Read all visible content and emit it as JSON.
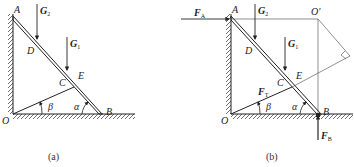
{
  "figure_a": {
    "caption": "(a)",
    "points": [
      "A",
      "B",
      "C",
      "D",
      "E",
      "O"
    ],
    "forces": [
      {
        "name": "G",
        "sub": "2"
      },
      {
        "name": "G",
        "sub": "1"
      }
    ],
    "angles": [
      "β",
      "α"
    ]
  },
  "figure_b": {
    "caption": "(b)",
    "points": [
      "A",
      "B",
      "C",
      "D",
      "E",
      "O",
      "O′"
    ],
    "forces": [
      {
        "name": "F",
        "sub": "A"
      },
      {
        "name": "G",
        "sub": "2"
      },
      {
        "name": "G",
        "sub": "1"
      },
      {
        "name": "F",
        "sub": "T"
      },
      {
        "name": "F",
        "sub": "B"
      }
    ],
    "angles": [
      "β",
      "α"
    ]
  }
}
